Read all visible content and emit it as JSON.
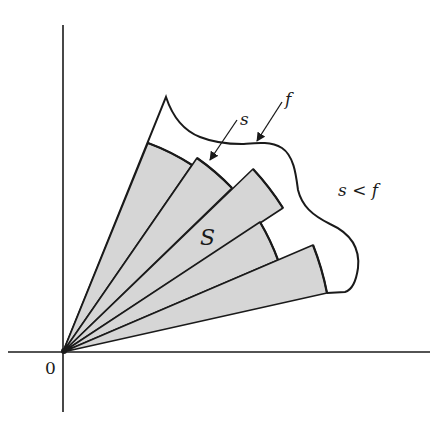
{
  "diagram": {
    "labels": {
      "origin": "0",
      "s_label": "s",
      "f_label": "f",
      "region_label": "S",
      "inequality": "s < f"
    },
    "colors": {
      "stroke": "#1a1a1a",
      "sector_fill": "#d6d6d6",
      "background": "#ffffff"
    },
    "axes": {
      "origin": [
        63,
        352
      ],
      "x_axis": {
        "from": [
          8,
          352
        ],
        "to": [
          430,
          352
        ]
      },
      "y_axis": {
        "from": [
          63,
          25
        ],
        "to": [
          63,
          412
        ]
      }
    },
    "sectors": [
      {
        "name": "sector-1",
        "corners": [
          [
            148,
            143
          ],
          [
            192,
            165
          ]
        ]
      },
      {
        "name": "sector-2",
        "corners": [
          [
            197,
            158
          ],
          [
            232,
            188
          ]
        ]
      },
      {
        "name": "sector-3",
        "corners": [
          [
            253,
            169
          ],
          [
            283,
            208
          ]
        ]
      },
      {
        "name": "sector-4",
        "corners": [
          [
            260,
            222
          ],
          [
            278,
            260
          ]
        ]
      },
      {
        "name": "sector-5",
        "corners": [
          [
            313,
            245
          ],
          [
            327,
            293
          ]
        ]
      }
    ],
    "arrows": [
      {
        "name": "s-arrow",
        "from": [
          237,
          120
        ],
        "to": [
          210,
          160
        ]
      },
      {
        "name": "f-arrow",
        "from": [
          282,
          102
        ],
        "to": [
          257,
          141
        ]
      }
    ]
  }
}
